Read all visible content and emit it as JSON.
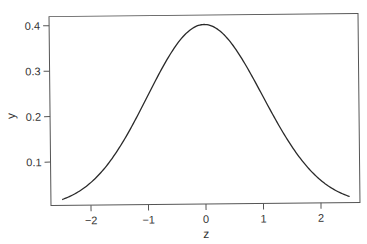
{
  "chart_data": {
    "type": "line",
    "title": "",
    "xlabel": "z",
    "ylabel": "y",
    "xlim": [
      -2.6,
      2.6
    ],
    "ylim": [
      0.01,
      0.42
    ],
    "grid": false,
    "legend": null,
    "x_ticks": [
      -2,
      -1,
      0,
      1,
      2
    ],
    "x_tick_labels": [
      "−2",
      "−1",
      "0",
      "1",
      "2"
    ],
    "y_ticks": [
      0.1,
      0.2,
      0.3,
      0.4
    ],
    "y_tick_labels": [
      "0.1",
      "0.2",
      "0.3",
      "0.4"
    ],
    "series": [
      {
        "name": "standard normal density",
        "function": "y = exp(-z^2/2)/sqrt(2*pi)",
        "x": [
          -2.5,
          -2.0,
          -1.5,
          -1.0,
          -0.5,
          0.0,
          0.5,
          1.0,
          1.5,
          2.0,
          2.5
        ],
        "y": [
          0.018,
          0.054,
          0.13,
          0.242,
          0.352,
          0.399,
          0.352,
          0.242,
          0.13,
          0.054,
          0.018
        ]
      }
    ]
  },
  "colors": {
    "line": "#2a2a2a",
    "frame": "#555555",
    "text": "#333333"
  }
}
